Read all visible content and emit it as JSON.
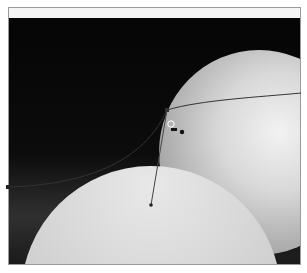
{
  "canvas": {
    "description": "Grayscale photo of an orange and an orange slice with a pen-tool path drawn over it",
    "colors": {
      "background": "#0a0a0a",
      "frame_border": "#9a9a9a",
      "path_stroke": "#333333"
    }
  },
  "path": {
    "anchor_points": [
      {
        "x": 8,
        "y": 187
      },
      {
        "x": 167,
        "y": 110
      },
      {
        "x": 301,
        "y": 93
      }
    ],
    "handle": {
      "from": {
        "x": 167,
        "y": 110
      },
      "to": {
        "x": 150,
        "y": 205
      }
    }
  }
}
